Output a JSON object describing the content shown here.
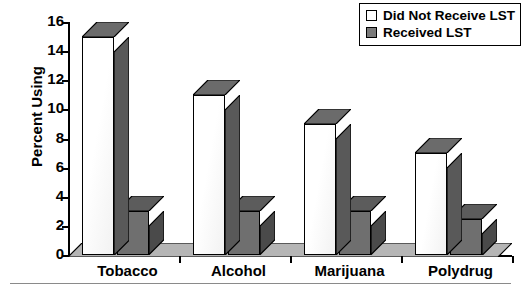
{
  "chart_data": {
    "type": "bar",
    "title": "",
    "xlabel": "",
    "ylabel": "Percent Using",
    "categories": [
      "Tobacco",
      "Alcohol",
      "Marijuana",
      "Polydrug"
    ],
    "series": [
      {
        "name": "Did Not Receive LST",
        "values": [
          15,
          11,
          9,
          7
        ],
        "color": "#ffffff"
      },
      {
        "name": "Received LST",
        "values": [
          3,
          3,
          3,
          2.5
        ],
        "color": "#6f6f6f"
      }
    ],
    "ylim": [
      0,
      16
    ],
    "yticks": [
      0,
      2,
      4,
      6,
      8,
      10,
      12,
      14,
      16
    ],
    "ytick_labels": [
      "0",
      "2",
      "4",
      "6",
      "8",
      "10",
      "12",
      "14",
      "16"
    ],
    "grid": false,
    "legend_position": "top-right",
    "style": "3d-bar"
  },
  "legend": {
    "entries": [
      {
        "label": "Did Not Receive LST",
        "swatch": "light"
      },
      {
        "label": "Received LST",
        "swatch": "dark"
      }
    ]
  },
  "colors": {
    "bar_light_face": "#ffffff",
    "bar_dark_face": "#6f6f6f",
    "bar_light_side": "#595959",
    "bar_dark_side": "#4a4a4a",
    "bar_light_top": "#6b6b6b",
    "bar_dark_top": "#5c5c5c",
    "floor": "#b5b5b5",
    "axis": "#000000"
  }
}
